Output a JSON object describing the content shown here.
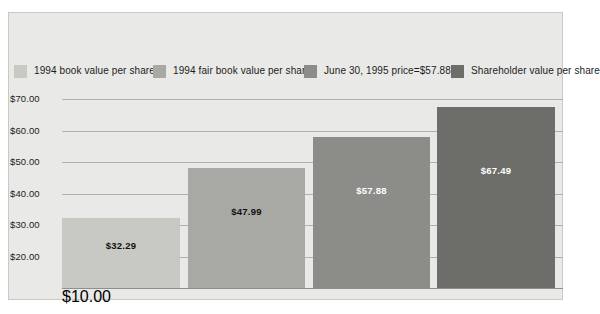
{
  "chart_data": {
    "type": "bar",
    "title": "",
    "xlabel": "",
    "ylabel": "",
    "ylim": [
      10,
      70
    ],
    "grid": true,
    "legend_position": "top",
    "categories": [
      "1994 book value per share",
      "1994 fair book value per share",
      "June 30, 1995 price=$57.88",
      "Shareholder value per share"
    ],
    "values": [
      32.29,
      47.99,
      57.88,
      67.49
    ],
    "value_labels": [
      "$32.29",
      "$47.99",
      "$57.88",
      "$67.49"
    ],
    "ytick_labels": [
      "$70.00",
      "$60.00",
      "$50.00",
      "$40.00",
      "$30.00",
      "$20.00",
      "$10.00"
    ],
    "ytick_values": [
      70,
      60,
      50,
      40,
      30,
      20,
      10
    ],
    "series": [
      {
        "name": "Shareholder value comparison",
        "values": [
          32.29,
          47.99,
          57.88,
          67.49
        ]
      }
    ],
    "bar_colors": [
      "#c9c9c4",
      "#a8a8a4",
      "#8c8c88",
      "#6d6d6a"
    ],
    "label_colors": [
      "#111111",
      "#111111",
      "#ffffff",
      "#ffffff"
    ]
  },
  "legend": {
    "items": [
      {
        "label": "1994 book value per share",
        "color": "#c9c9c4"
      },
      {
        "label": "1994 fair book value per share",
        "color": "#a8a8a4"
      },
      {
        "label": "June 30, 1995 price=$57.88",
        "color": "#8c8c88"
      },
      {
        "label": "Shareholder value per share",
        "color": "#6d6d6a"
      }
    ]
  },
  "colors": {
    "panel_background": "#e9e9e7",
    "panel_border": "#c9c9c5",
    "gridline": "#b0b0ac",
    "baseline": "#8f8f8b",
    "page_background": "#ffffff",
    "text": "#1c1c1c"
  }
}
